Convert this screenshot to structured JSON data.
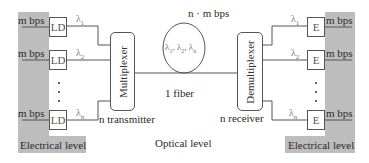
{
  "diagram": {
    "left": {
      "rate_labels": [
        "m bps",
        "m bps",
        "m bps"
      ],
      "transmitters": [
        "LD",
        "LD",
        "LD"
      ],
      "wavelengths": [
        {
          "symbol": "λ",
          "sub": "1"
        },
        {
          "symbol": "λ",
          "sub": "2"
        },
        {
          "symbol": "λ",
          "sub": "n"
        }
      ],
      "ellipsis": "⋮",
      "level_label": "Electrical level"
    },
    "multiplexer": {
      "label": "Multiplexer",
      "caption": "n transmitter"
    },
    "fiber": {
      "rate": "n · m bps",
      "wavelengths_in_fiber": [
        {
          "symbol": "λ",
          "sub": "1"
        },
        {
          "symbol": "λ",
          "sub": "2"
        },
        {
          "symbol": "λ",
          "sub": "n"
        }
      ],
      "label": "1 fiber",
      "level_label": "Optical level"
    },
    "demultiplexer": {
      "label": "Demultiplexer",
      "caption": "n receiver"
    },
    "right": {
      "receivers": [
        "E",
        "E",
        "E"
      ],
      "wavelengths": [
        {
          "symbol": "λ",
          "sub": "1"
        },
        {
          "symbol": "λ",
          "sub": "2"
        },
        {
          "symbol": "λ",
          "sub": "n"
        }
      ],
      "rate_labels": [
        "m bps",
        "m bps",
        "m bps"
      ],
      "ellipsis": "⋮",
      "level_label": "Electrical level"
    },
    "colors": {
      "panel_grey": "#bdbdbd",
      "line": "#555555",
      "lambda_text": "#777777"
    }
  }
}
